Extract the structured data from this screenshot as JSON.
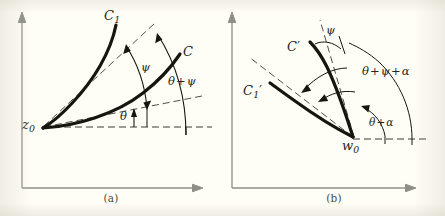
{
  "figure": {
    "background_color": "#fefdf6",
    "ink_color": "#262620",
    "axis_color": "#8e8e84",
    "curve_color": "#1a1a16",
    "panels": [
      {
        "id": "a",
        "caption": "(a)",
        "vertex_label": {
          "base": "z",
          "sub": "0",
          "prime": ""
        },
        "curves": [
          {
            "name": "C1",
            "base": "C",
            "sub": "1",
            "prime": ""
          },
          {
            "name": "C",
            "base": "C",
            "sub": "",
            "prime": ""
          }
        ],
        "angles": [
          {
            "name": "theta",
            "text": "θ"
          },
          {
            "name": "psi",
            "text": "ψ"
          },
          {
            "name": "theta-plus-psi",
            "parts": [
              "θ",
              "+",
              "ψ"
            ]
          }
        ]
      },
      {
        "id": "b",
        "caption": "(b)",
        "vertex_label": {
          "base": "w",
          "sub": "0",
          "prime": ""
        },
        "curves": [
          {
            "name": "C1-prime",
            "base": "C",
            "sub": "1",
            "prime": "′"
          },
          {
            "name": "C-prime",
            "base": "C",
            "sub": "",
            "prime": "′"
          }
        ],
        "angles": [
          {
            "name": "theta-plus-alpha",
            "parts": [
              "θ",
              "+",
              "α"
            ]
          },
          {
            "name": "psi",
            "text": "ψ"
          },
          {
            "name": "theta-plus-psi-plus-alpha",
            "parts": [
              "θ",
              "+",
              "ψ",
              "+",
              "α"
            ]
          }
        ]
      }
    ]
  },
  "labels": {
    "a": {
      "C1": {
        "base": "C",
        "sub": "1"
      },
      "C": {
        "base": "C",
        "sub": ""
      },
      "z0": {
        "base": "z",
        "sub": "0"
      },
      "theta": "θ",
      "psi": "ψ",
      "theta_psi_1": "θ",
      "theta_psi_op": "+",
      "theta_psi_2": "ψ",
      "caption": "(a)"
    },
    "b": {
      "C1p": {
        "base": "C",
        "sub": "1",
        "prime": "′"
      },
      "Cp": {
        "base": "C",
        "prime": "′"
      },
      "w0": {
        "base": "w",
        "sub": "0"
      },
      "psi": "ψ",
      "tpa_1": "θ",
      "tpa_op": "+",
      "tpa_2": "α",
      "tpsa_1": "θ",
      "tpsa_op1": "+",
      "tpsa_2": "ψ",
      "tpsa_op2": "+",
      "tpsa_3": "α",
      "caption": "(b)"
    }
  }
}
